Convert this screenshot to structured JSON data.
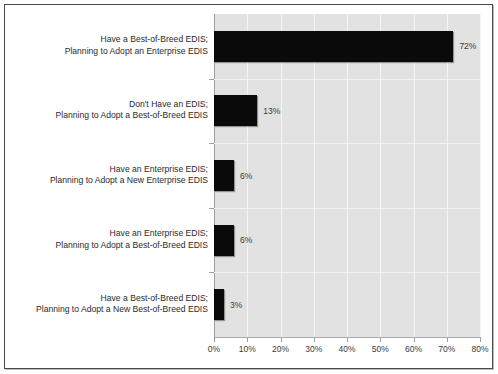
{
  "chart_data": {
    "type": "bar",
    "orientation": "horizontal",
    "title": "",
    "xlabel": "",
    "ylabel": "",
    "xlim": [
      0,
      80
    ],
    "xtick_labels": [
      "0%",
      "10%",
      "20%",
      "30%",
      "40%",
      "50%",
      "60%",
      "70%",
      "80%"
    ],
    "xtick_values": [
      0,
      10,
      20,
      30,
      40,
      50,
      60,
      70,
      80
    ],
    "grid": true,
    "legend": false,
    "bar_color": "#0a0a0a",
    "plot_background": "#e2e2e2",
    "gridline_color": "#f4f4f4",
    "categories": [
      "Have a Best-of-Breed EDIS;\nPlanning to Adopt an Enterprise EDIS",
      "Don't Have an EDIS;\nPlanning to Adopt a Best-of-Breed EDIS",
      "Have an Enterprise EDIS;\nPlanning to Adopt a New Enterprise EDIS",
      "Have an Enterprise EDIS;\nPlanning to Adopt a Best-of-Breed EDIS",
      "Have a Best-of-Breed EDIS;\nPlanning to Adopt a New Best-of-Breed EDIS"
    ],
    "values": [
      72,
      13,
      6,
      6,
      3
    ],
    "data_labels": [
      "72%",
      "13%",
      "6%",
      "6%",
      "3%"
    ]
  }
}
